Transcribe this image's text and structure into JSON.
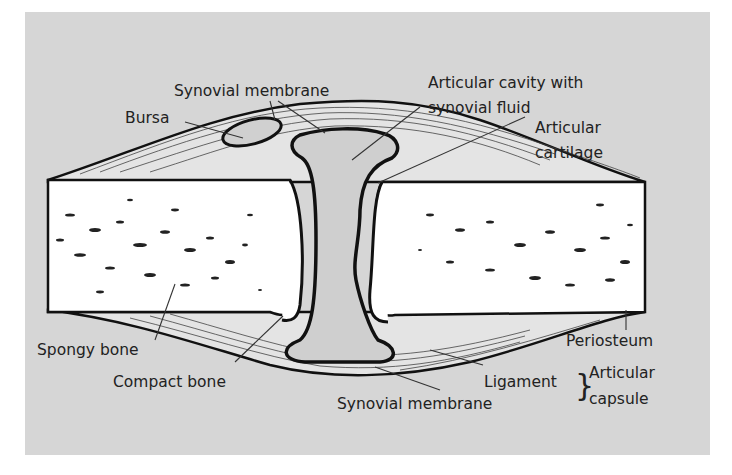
{
  "figure": {
    "type": "anatomical-diagram",
    "colors": {
      "background": "#ffffff",
      "panel": "#d6d6d6",
      "bone": "#ffffff",
      "outline": "#111111",
      "text": "#222222"
    }
  },
  "labels": {
    "synovial_membrane_top": "Synovial membrane",
    "bursa": "Bursa",
    "articular_cavity_line1": "Articular cavity with",
    "articular_cavity_line2": "synovial fluid",
    "articular_cartilage_line1": "Articular",
    "articular_cartilage_line2": "cartilage",
    "spongy_bone": "Spongy bone",
    "compact_bone": "Compact bone",
    "synovial_membrane_bottom": "Synovial membrane",
    "ligament": "Ligament",
    "periosteum": "Periosteum",
    "articular_capsule_line1": "Articular",
    "articular_capsule_line2": "capsule",
    "capsule_brace": "}"
  }
}
